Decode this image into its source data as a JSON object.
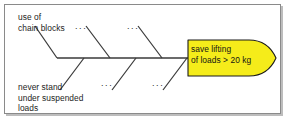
{
  "diagram": {
    "type": "fishbone-ishikawa",
    "title": "",
    "colors": {
      "background": "#ffffff",
      "frame_border": "#8a8a8a",
      "frame_shadow": "#bdbdbd",
      "bone_line": "#3a3a3a",
      "arrow_fill": "#f5ec1a",
      "arrow_stroke": "#1a1a1a",
      "text": "#1c1c1c"
    },
    "spine": {
      "label": "fishbone-spine",
      "x1": 57,
      "y1": 58,
      "x2": 200,
      "y2": 58
    },
    "causes": {
      "upper": [
        {
          "label": "use of\nchain blocks",
          "placeholder": false
        },
        {
          "label": "...",
          "placeholder": true
        },
        {
          "label": "...",
          "placeholder": true
        }
      ],
      "lower": [
        {
          "label": "never stand\nunder suspended\nloads",
          "placeholder": false
        },
        {
          "label": "...",
          "placeholder": true
        },
        {
          "label": "...",
          "placeholder": true
        }
      ]
    },
    "labels": {
      "top_left": "use of\nchain blocks",
      "bottom_left": "never stand\nunder suspended\nloads",
      "dots_top_1": "...",
      "dots_top_2": "...",
      "dots_bottom_1": "...",
      "dots_bottom_2": "..."
    },
    "effect_banner": {
      "name": "effect-arrow",
      "line1": "save lifting",
      "line2": "of loads > 20 kg",
      "fill": "#f5ec1a"
    }
  }
}
